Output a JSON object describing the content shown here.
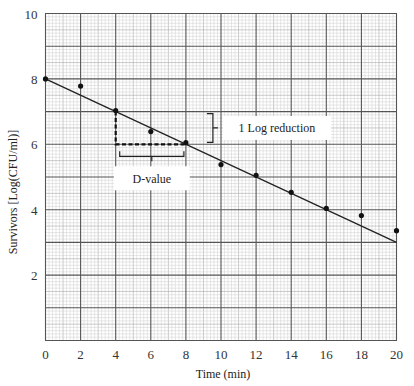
{
  "chart_data": {
    "type": "scatter",
    "title": "",
    "xlabel": "Time (min)",
    "ylabel": "Survivors [Log(CFU/ml)]",
    "xlim": [
      0,
      20
    ],
    "ylim": [
      0,
      10
    ],
    "grid": true,
    "x_ticks": [
      0,
      2,
      4,
      6,
      8,
      10,
      12,
      14,
      16,
      18,
      20
    ],
    "y_ticks": [
      2,
      4,
      6,
      8,
      10
    ],
    "x_tick_labels": [
      "0",
      "2",
      "4",
      "6",
      "8",
      "10",
      "12",
      "14",
      "16",
      "18",
      "20"
    ],
    "y_tick_labels": [
      "2",
      "4",
      "6",
      "8",
      "10"
    ],
    "series": [
      {
        "name": "Survivors",
        "type": "scatter",
        "x": [
          0,
          2,
          4,
          6,
          8,
          10,
          12,
          14,
          16,
          18,
          20
        ],
        "y": [
          8.0,
          7.78,
          7.03,
          6.39,
          6.05,
          5.38,
          5.05,
          4.53,
          4.04,
          3.82,
          3.36
        ]
      },
      {
        "name": "Fitted line",
        "type": "line",
        "x": [
          0,
          20
        ],
        "y": [
          8.0,
          3.0
        ]
      }
    ],
    "annotations": [
      {
        "text": "1 Log reduction",
        "kind": "bracket-vertical",
        "from": [
          8,
          6
        ],
        "to": [
          8,
          7
        ]
      },
      {
        "text": "D-value",
        "kind": "bracket-horizontal",
        "from": [
          4,
          6
        ],
        "to": [
          8,
          6
        ]
      },
      {
        "kind": "dashed-guide",
        "points": [
          [
            4,
            7
          ],
          [
            4,
            6
          ],
          [
            8,
            6
          ]
        ]
      }
    ]
  }
}
